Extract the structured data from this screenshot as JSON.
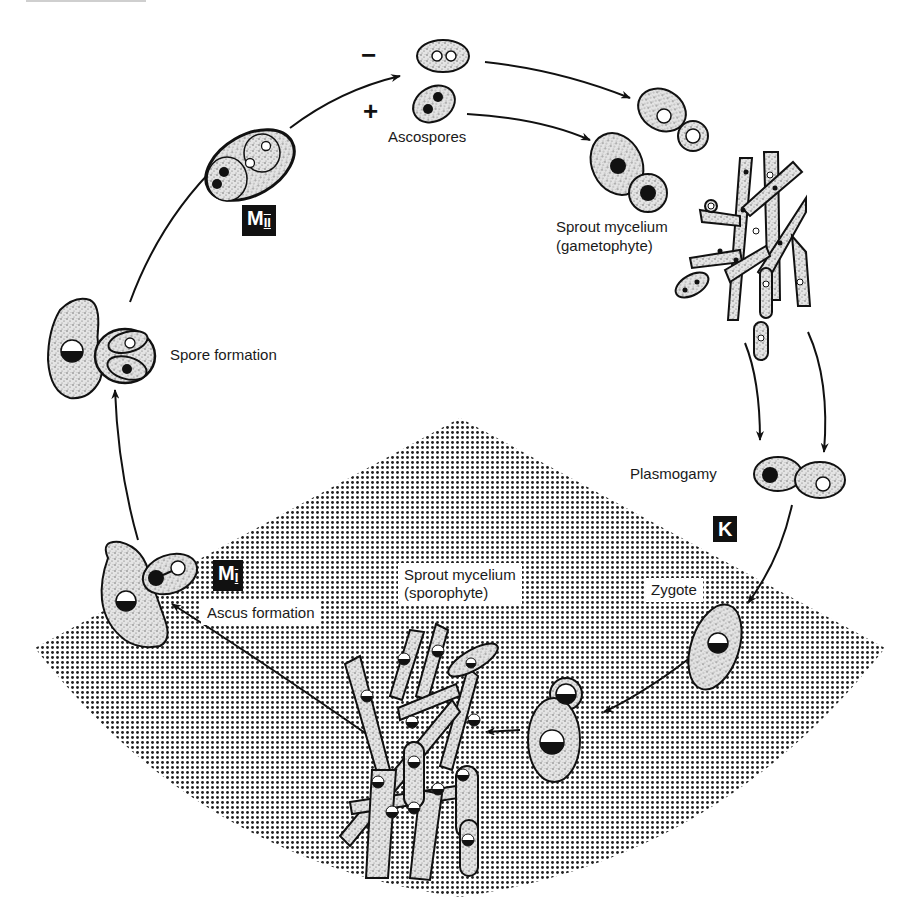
{
  "diagram": {
    "colors": {
      "ink": "#111111",
      "cell_fill": "#d6d6d6",
      "sector_dots": "#222222",
      "background": "#ffffff"
    },
    "labels": {
      "ascospores": "Ascospores",
      "minus_sign": "−",
      "plus_sign": "+",
      "sprout_gametophyte_l1": "Sprout mycelium",
      "sprout_gametophyte_l2": "(gametophyte)",
      "plasmogamy": "Plasmogamy",
      "karyogamy_badge": "K",
      "zygote": "Zygote",
      "sprout_sporophyte_l1": "Sprout mycelium",
      "sprout_sporophyte_l2": "(sporophyte)",
      "ascus_formation": "Ascus formation",
      "meiosis1_badge_main": "M",
      "meiosis1_badge_sub": "I",
      "spore_formation": "Spore formation",
      "meiosis2_badge_main": "M",
      "meiosis2_badge_sub": "II"
    },
    "stages": [
      {
        "id": "ascospores",
        "ploidy": "haploid",
        "mating_types": [
          "−",
          "+"
        ]
      },
      {
        "id": "sprout-mycelium-gametophyte",
        "ploidy": "haploid"
      },
      {
        "id": "plasmogamy",
        "ploidy": "n+n"
      },
      {
        "id": "karyogamy",
        "marker": "K"
      },
      {
        "id": "zygote",
        "ploidy": "diploid"
      },
      {
        "id": "sprout-mycelium-sporophyte",
        "ploidy": "diploid"
      },
      {
        "id": "ascus-formation",
        "marker": "MI"
      },
      {
        "id": "spore-formation"
      },
      {
        "id": "ascus-with-spores",
        "marker": "MII"
      }
    ]
  }
}
